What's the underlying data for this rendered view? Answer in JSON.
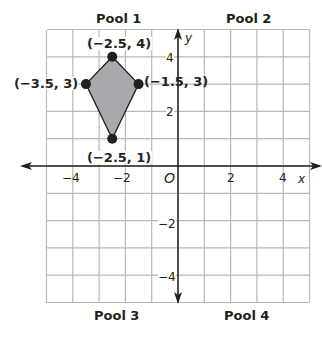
{
  "diagram": {
    "type": "coordinate-plane",
    "grid": {
      "xmin": -5,
      "xmax": 5,
      "ymin": -5,
      "ymax": 5,
      "step": 1
    },
    "axes": {
      "x_label": "x",
      "y_label": "y",
      "origin_label": "O"
    },
    "x_ticks": [
      {
        "value": -4,
        "label": "−4"
      },
      {
        "value": -2,
        "label": "−2"
      },
      {
        "value": 2,
        "label": "2"
      },
      {
        "value": 4,
        "label": "4"
      }
    ],
    "y_ticks": [
      {
        "value": 4,
        "label": "4"
      },
      {
        "value": 2,
        "label": "2"
      },
      {
        "value": -2,
        "label": "−2"
      },
      {
        "value": -4,
        "label": "−4"
      }
    ],
    "quadrant_labels": {
      "q1": "Pool 1",
      "q2": "Pool 2",
      "q3": "Pool 3",
      "q4": "Pool 4"
    },
    "shape": {
      "name": "kite",
      "fill": "#a7a9ac",
      "vertices": [
        {
          "x": -2.5,
          "y": 4,
          "label": "(−2.5, 4)"
        },
        {
          "x": -1.5,
          "y": 3,
          "label": "(−1.5, 3)"
        },
        {
          "x": -2.5,
          "y": 1,
          "label": "(−2.5, 1)"
        },
        {
          "x": -3.5,
          "y": 3,
          "label": "(−3.5, 3)"
        }
      ]
    },
    "colors": {
      "grid": "#b8b8b8",
      "axis": "#231f20",
      "text": "#231f20"
    }
  }
}
